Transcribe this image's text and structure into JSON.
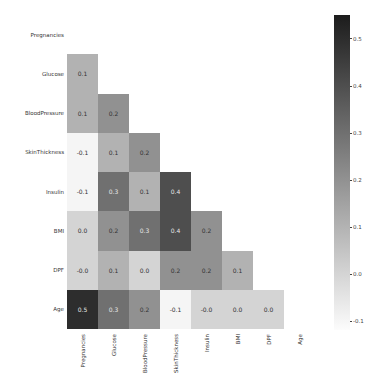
{
  "chart_data": {
    "type": "heatmap",
    "title": "",
    "xlabel": "",
    "ylabel": "",
    "mask": "upper-triangle (diagonal and above hidden)",
    "colormap": "Greys",
    "vmin": -0.12,
    "vmax": 0.55,
    "labels": [
      "Pregnancies",
      "Glucose",
      "BloodPressure",
      "SkinThickness",
      "Insulin",
      "BMI",
      "DPF",
      "Age"
    ],
    "values": [
      [
        null,
        null,
        null,
        null,
        null,
        null,
        null,
        null
      ],
      [
        0.1,
        null,
        null,
        null,
        null,
        null,
        null,
        null
      ],
      [
        0.1,
        0.2,
        null,
        null,
        null,
        null,
        null,
        null
      ],
      [
        -0.1,
        0.1,
        0.2,
        null,
        null,
        null,
        null,
        null
      ],
      [
        -0.1,
        0.3,
        0.1,
        0.4,
        null,
        null,
        null,
        null
      ],
      [
        0.0,
        0.2,
        0.3,
        0.4,
        0.2,
        null,
        null,
        null
      ],
      [
        -0.0,
        0.1,
        0.0,
        0.2,
        0.2,
        0.1,
        null,
        null
      ],
      [
        0.5,
        0.3,
        0.2,
        -0.1,
        -0.0,
        0.0,
        0.0,
        null
      ]
    ],
    "annotations": [
      [
        "",
        "",
        "",
        "",
        "",
        "",
        "",
        ""
      ],
      [
        "0.1",
        "",
        "",
        "",
        "",
        "",
        "",
        ""
      ],
      [
        "0.1",
        "0.2",
        "",
        "",
        "",
        "",
        "",
        ""
      ],
      [
        "-0.1",
        "0.1",
        "0.2",
        "",
        "",
        "",
        "",
        ""
      ],
      [
        "-0.1",
        "0.3",
        "0.1",
        "0.4",
        "",
        "",
        "",
        ""
      ],
      [
        "0.0",
        "0.2",
        "0.3",
        "0.4",
        "0.2",
        "",
        "",
        ""
      ],
      [
        "-0.0",
        "0.1",
        "0.0",
        "0.2",
        "0.2",
        "0.1",
        "",
        ""
      ],
      [
        "0.5",
        "0.3",
        "0.2",
        "-0.1",
        "-0.0",
        "0.0",
        "0.0",
        ""
      ]
    ],
    "colorbar": {
      "ticks": [
        "0.5",
        "0.4",
        "0.3",
        "0.2",
        "0.1",
        "0.0",
        "-0.1"
      ],
      "tick_values": [
        0.5,
        0.4,
        0.3,
        0.2,
        0.1,
        0.0,
        -0.1
      ]
    }
  }
}
